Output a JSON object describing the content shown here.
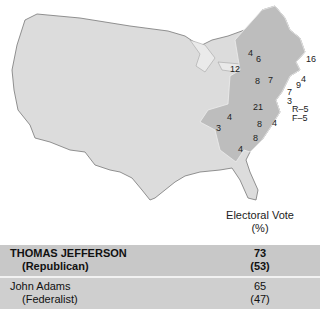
{
  "map": {
    "description": "Election of 1800 electoral map of the United States",
    "state_labels": [
      {
        "id": "vermont",
        "text": "4"
      },
      {
        "id": "new-hampshire",
        "text": "6"
      },
      {
        "id": "massachusetts",
        "text": "16"
      },
      {
        "id": "new-york",
        "text": "12"
      },
      {
        "id": "rhode-island",
        "text": "4"
      },
      {
        "id": "connecticut",
        "text": "9"
      },
      {
        "id": "new-jersey",
        "text": "7"
      },
      {
        "id": "delaware",
        "text": "3"
      },
      {
        "id": "pennsylvania-west",
        "text": "8"
      },
      {
        "id": "pennsylvania-east",
        "text": "7"
      },
      {
        "id": "maryland-r",
        "text": "R–5"
      },
      {
        "id": "maryland-f",
        "text": "F–5"
      },
      {
        "id": "virginia",
        "text": "21"
      },
      {
        "id": "kentucky",
        "text": "4"
      },
      {
        "id": "tennessee",
        "text": "3"
      },
      {
        "id": "north-carolina-r",
        "text": "8"
      },
      {
        "id": "north-carolina-f",
        "text": "4"
      },
      {
        "id": "south-carolina",
        "text": "8"
      },
      {
        "id": "georgia",
        "text": "4"
      }
    ]
  },
  "table": {
    "header_line1": "Electoral Vote",
    "header_line2": "(%)",
    "rows": [
      {
        "candidate": "THOMAS JEFFERSON",
        "party": "(Republican)",
        "votes": "73",
        "percent": "(53)"
      },
      {
        "candidate": "John Adams",
        "party": "(Federalist)",
        "votes": "65",
        "percent": "(47)"
      }
    ]
  },
  "colors": {
    "map_fill": "#dcdcdc",
    "states_fill": "#bdbdbd",
    "row_winner": "#c8c8c8",
    "row_loser": "#cfcfcf"
  }
}
